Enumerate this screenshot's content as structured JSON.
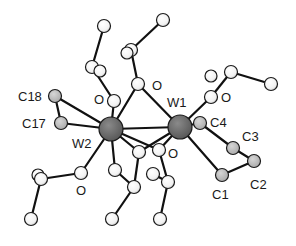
{
  "figure": {
    "type": "ball-and-stick molecular structure",
    "background": "#ffffff"
  },
  "colors": {
    "tungsten": "#6b6b6b",
    "labeled_carbon": "#bdbdbd",
    "other_atom": "#ffffff",
    "bond": "#111111"
  },
  "atoms": [
    {
      "id": "W1",
      "label": "W1",
      "element": "W",
      "x": 180,
      "y": 127,
      "r": 12,
      "label_x": 167,
      "label_y": 107,
      "show_label": true
    },
    {
      "id": "W2",
      "label": "W2",
      "element": "W",
      "x": 111,
      "y": 129,
      "r": 12,
      "label_x": 72,
      "label_y": 148,
      "show_label": true
    },
    {
      "id": "C18",
      "label": "C18",
      "element": "C",
      "x": 55,
      "y": 96,
      "r": 6.5,
      "label_x": 18,
      "label_y": 101,
      "show_label": true
    },
    {
      "id": "C17",
      "label": "C17",
      "element": "C",
      "x": 61,
      "y": 123,
      "r": 6.5,
      "label_x": 22,
      "label_y": 128,
      "show_label": true
    },
    {
      "id": "C4",
      "label": "C4",
      "element": "C",
      "x": 200,
      "y": 123,
      "r": 6.5,
      "label_x": 210,
      "label_y": 127,
      "show_label": true
    },
    {
      "id": "C3",
      "label": "C3",
      "element": "C",
      "x": 233,
      "y": 148,
      "r": 6.5,
      "label_x": 242,
      "label_y": 141,
      "show_label": true
    },
    {
      "id": "C2",
      "label": "C2",
      "element": "C",
      "x": 254,
      "y": 161,
      "r": 6.5,
      "label_x": 250,
      "label_y": 189,
      "show_label": true
    },
    {
      "id": "C1",
      "label": "C1",
      "element": "C",
      "x": 222,
      "y": 175,
      "r": 6.5,
      "label_x": 212,
      "label_y": 199,
      "show_label": true
    },
    {
      "id": "O_top",
      "label": "O",
      "element": "O",
      "x": 138,
      "y": 84,
      "r": 6.5,
      "label_x": 152,
      "label_y": 90,
      "show_label": true
    },
    {
      "id": "O_upleft",
      "label": "O",
      "element": "O",
      "x": 114,
      "y": 101,
      "r": 6.5,
      "label_x": 94,
      "label_y": 104,
      "show_label": true
    },
    {
      "id": "O_upright",
      "label": "O",
      "element": "O",
      "x": 211,
      "y": 97,
      "r": 6.5,
      "label_x": 221,
      "label_y": 102,
      "show_label": true
    },
    {
      "id": "O_lowleft",
      "label": "O",
      "element": "O",
      "x": 81,
      "y": 173,
      "r": 6.5,
      "label_x": 76,
      "label_y": 195,
      "show_label": true
    },
    {
      "id": "O_bot1",
      "label": "",
      "element": "O",
      "x": 139,
      "y": 152,
      "r": 6.5,
      "show_label": false
    },
    {
      "id": "O_bot2",
      "label": "O",
      "element": "O",
      "x": 159,
      "y": 150,
      "r": 6.5,
      "label_x": 168,
      "label_y": 158,
      "show_label": true
    },
    {
      "id": "Ca",
      "label": "",
      "element": "C",
      "x": 104,
      "y": 26,
      "r": 6.5,
      "show_label": false
    },
    {
      "id": "Cb",
      "label": "",
      "element": "C",
      "x": 92,
      "y": 67,
      "r": 6.5,
      "show_label": false
    },
    {
      "id": "Cb2",
      "label": "",
      "element": "C",
      "x": 100,
      "y": 71,
      "r": 6,
      "show_label": false
    },
    {
      "id": "Cc",
      "label": "",
      "element": "C",
      "x": 163,
      "y": 20,
      "r": 6.5,
      "show_label": false
    },
    {
      "id": "Cd",
      "label": "",
      "element": "C",
      "x": 131,
      "y": 50,
      "r": 6.5,
      "show_label": false
    },
    {
      "id": "Cd2",
      "label": "",
      "element": "C",
      "x": 127,
      "y": 53,
      "r": 6,
      "show_label": false
    },
    {
      "id": "Ce",
      "label": "",
      "element": "C",
      "x": 231,
      "y": 72,
      "r": 6.5,
      "show_label": false
    },
    {
      "id": "Ce2",
      "label": "",
      "element": "C",
      "x": 211,
      "y": 76,
      "r": 6,
      "show_label": false
    },
    {
      "id": "Cf",
      "label": "",
      "element": "C",
      "x": 271,
      "y": 84,
      "r": 6.5,
      "show_label": false
    },
    {
      "id": "Cg",
      "label": "",
      "element": "C",
      "x": 41,
      "y": 179,
      "r": 6.5,
      "show_label": false
    },
    {
      "id": "Cg2",
      "label": "",
      "element": "C",
      "x": 38,
      "y": 175,
      "r": 6,
      "show_label": false
    },
    {
      "id": "Ch",
      "label": "",
      "element": "C",
      "x": 31,
      "y": 219,
      "r": 6.5,
      "show_label": false
    },
    {
      "id": "Ci",
      "label": "",
      "element": "C",
      "x": 134,
      "y": 187,
      "r": 6.5,
      "show_label": false
    },
    {
      "id": "Cj",
      "label": "",
      "element": "C",
      "x": 115,
      "y": 170,
      "r": 6.5,
      "show_label": false
    },
    {
      "id": "Ck",
      "label": "",
      "element": "C",
      "x": 112,
      "y": 219,
      "r": 6.5,
      "show_label": false
    },
    {
      "id": "Cl",
      "label": "",
      "element": "C",
      "x": 168,
      "y": 182,
      "r": 6.5,
      "show_label": false
    },
    {
      "id": "Cm",
      "label": "",
      "element": "C",
      "x": 153,
      "y": 174,
      "r": 6.5,
      "show_label": false
    },
    {
      "id": "Cn",
      "label": "",
      "element": "C",
      "x": 160,
      "y": 219,
      "r": 6.5,
      "show_label": false
    }
  ],
  "bonds": [
    [
      "W1",
      "W2"
    ],
    [
      "W2",
      "O_top"
    ],
    [
      "W1",
      "O_top"
    ],
    [
      "W2",
      "O_upleft"
    ],
    [
      "W2",
      "C18"
    ],
    [
      "W2",
      "C17"
    ],
    [
      "C18",
      "C17"
    ],
    [
      "W1",
      "O_upright"
    ],
    [
      "W1",
      "C4"
    ],
    [
      "C4",
      "C3"
    ],
    [
      "C3",
      "C2"
    ],
    [
      "C2",
      "C1"
    ],
    [
      "C1",
      "W1"
    ],
    [
      "W2",
      "O_lowleft"
    ],
    [
      "W2",
      "O_bot1"
    ],
    [
      "W1",
      "O_bot1"
    ],
    [
      "W2",
      "O_bot2"
    ],
    [
      "W1",
      "O_bot2"
    ],
    [
      "W2",
      "Cj"
    ],
    [
      "O_upleft",
      "Cb"
    ],
    [
      "Cb",
      "Ca"
    ],
    [
      "O_top",
      "Cd"
    ],
    [
      "Cd",
      "Cc"
    ],
    [
      "O_upright",
      "Ce"
    ],
    [
      "Ce",
      "Cf"
    ],
    [
      "O_lowleft",
      "Cg"
    ],
    [
      "Cg",
      "Ch"
    ],
    [
      "O_bot1",
      "Ci"
    ],
    [
      "Ci",
      "Ck"
    ],
    [
      "O_bot2",
      "Cl"
    ],
    [
      "Cl",
      "Cn"
    ],
    [
      "Cl",
      "Cm"
    ],
    [
      "Ci",
      "Cj"
    ]
  ]
}
